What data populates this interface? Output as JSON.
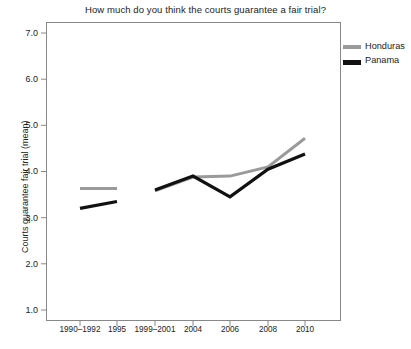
{
  "chart_data": {
    "type": "line",
    "title": "How much do you think the courts guarantee a fair trial?",
    "xlabel": "",
    "ylabel": "Courts guarantee fair trial (mean)",
    "categories": [
      "1990–1992",
      "1995",
      "1999–2001",
      "2004",
      "2006",
      "2008",
      "2010"
    ],
    "ylim": [
      1.0,
      7.0
    ],
    "ytick_labels": [
      "1.0",
      "2.0",
      "3.0",
      "4.0",
      "5.0",
      "6.0",
      "7.0"
    ],
    "ytick_values": [
      1.0,
      2.0,
      3.0,
      4.0,
      5.0,
      6.0,
      7.0
    ],
    "grid": false,
    "legend_position": "right-top",
    "series": [
      {
        "name": "Honduras",
        "color": "#9a9a9a",
        "values": [
          3.63,
          3.63,
          3.58,
          3.88,
          3.9,
          4.1,
          4.72
        ],
        "gaps_after": [
          "1995"
        ]
      },
      {
        "name": "Panama",
        "color": "#111111",
        "values": [
          3.2,
          3.35,
          3.6,
          3.9,
          3.45,
          4.05,
          4.38
        ],
        "gaps_after": [
          "1995"
        ]
      }
    ]
  },
  "legend": {
    "items": [
      {
        "label": "Honduras",
        "color": "#9a9a9a"
      },
      {
        "label": "Panama",
        "color": "#111111"
      }
    ]
  },
  "axes": {
    "frame_color": "#888888"
  }
}
